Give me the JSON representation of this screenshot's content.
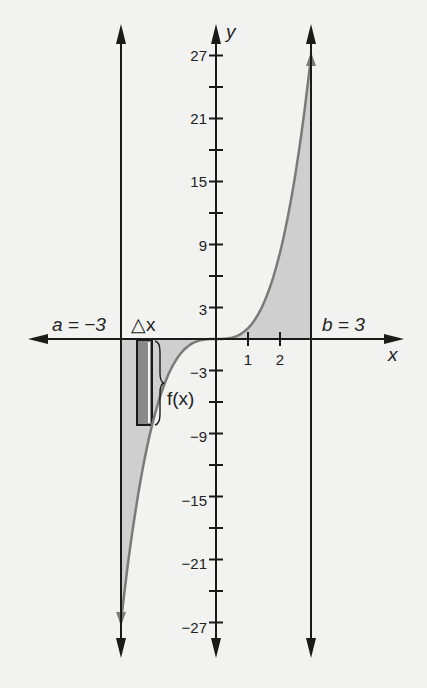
{
  "chart_data": {
    "type": "area",
    "title": "",
    "function": "f(x) = x^3",
    "xlabel": "x",
    "ylabel": "y",
    "xlim": [
      -3,
      3
    ],
    "ylim": [
      -27,
      27
    ],
    "x_ticks": [
      1,
      2
    ],
    "x_tick_labels": [
      "1",
      "2"
    ],
    "y_ticks": [
      -27,
      -24,
      -21,
      -18,
      -15,
      -12,
      -9,
      -6,
      -3,
      3,
      6,
      9,
      12,
      15,
      18,
      21,
      24,
      27
    ],
    "y_tick_labels": {
      "27": "27",
      "21": "21",
      "15": "15",
      "9": "9",
      "3": "3",
      "-3": "−3",
      "-9": "−9",
      "-15": "−15",
      "-21": "−21",
      "-27": "−27"
    },
    "x": [
      -3,
      -2.5,
      -2,
      -1.5,
      -1,
      -0.5,
      0,
      0.5,
      1,
      1.5,
      2,
      2.5,
      3
    ],
    "values": [
      -27,
      -15.625,
      -8,
      -3.375,
      -1,
      -0.125,
      0,
      0.125,
      1,
      3.375,
      8,
      15.625,
      27
    ],
    "shaded_region": {
      "from": -3,
      "to": 3,
      "between": "curve and x-axis"
    },
    "annotations": [
      {
        "text": "a = −3",
        "at_x": -3
      },
      {
        "text": "b = 3",
        "at_x": 3
      },
      {
        "text": "△x",
        "meaning": "rectangle width"
      },
      {
        "text": "f(x)",
        "meaning": "rectangle height"
      }
    ],
    "rectangle": {
      "x_from": -2.5,
      "x_to": -2.0,
      "height_value": -8
    },
    "grid": false,
    "legend": null
  },
  "labels": {
    "y_axis": "y",
    "x_axis": "x",
    "a_label": "a = −3",
    "b_label": "b = 3",
    "delta_x": "△x",
    "fx": "f(x)",
    "t27": "27",
    "t21": "21",
    "t15": "15",
    "t9": "9",
    "t3": "3",
    "tm3": "−3",
    "tm9": "−9",
    "tm15": "−15",
    "tm21": "−21",
    "tm27": "−27",
    "x1": "1",
    "x2": "2"
  },
  "colors": {
    "axis": "#1a1a1a",
    "curve": "#7a7a7a",
    "shade": "#cfcfcf",
    "rect_fill": "#8a8a8a",
    "background": "#f2f2f0"
  }
}
